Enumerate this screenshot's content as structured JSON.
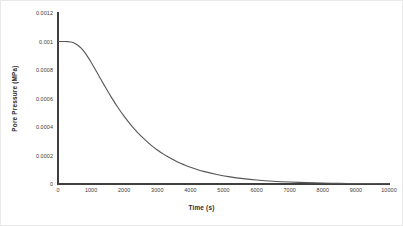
{
  "chart_data": {
    "type": "line",
    "title": "",
    "xlabel": "Time (s)",
    "ylabel": "Pore Pressure (MPa)",
    "xlim": [
      0,
      10000
    ],
    "ylim": [
      0,
      0.0012
    ],
    "grid": false,
    "legend": null,
    "xticks": [
      "0",
      "1000",
      "2000",
      "3000",
      "4000",
      "5000",
      "6000",
      "7000",
      "8000",
      "9000",
      "10000"
    ],
    "xtick_values": [
      0,
      1000,
      2000,
      3000,
      4000,
      5000,
      6000,
      7000,
      8000,
      9000,
      10000
    ],
    "yticks": [
      "0",
      "0.0002",
      "0.0004",
      "0.0006",
      "0.0008",
      "0.001",
      "0.0012"
    ],
    "ytick_values": [
      0,
      0.0002,
      0.0004,
      0.0006,
      0.0008,
      0.001,
      0.0012
    ],
    "series": [
      {
        "name": "Pore Pressure",
        "color": "#555555",
        "x": [
          0,
          100,
          200,
          300,
          400,
          500,
          600,
          700,
          800,
          900,
          1000,
          1200,
          1400,
          1600,
          1800,
          2000,
          2200,
          2400,
          2600,
          2800,
          3000,
          3200,
          3400,
          3600,
          3800,
          4000,
          4400,
          4800,
          5200,
          5600,
          6000,
          6500,
          7000,
          7500,
          8000,
          8500,
          9000,
          9500,
          10000
        ],
        "y": [
          0.001,
          0.001,
          0.001,
          0.000999,
          0.000996,
          0.000988,
          0.000974,
          0.000953,
          0.000925,
          0.000892,
          0.000855,
          0.000774,
          0.000692,
          0.000613,
          0.00054,
          0.000474,
          0.000415,
          0.000362,
          0.000316,
          0.000275,
          0.000239,
          0.000208,
          0.000181,
          0.000157,
          0.000136,
          0.000118,
          8.87e-05,
          6.66e-05,
          5e-05,
          3.75e-05,
          2.82e-05,
          1.97e-05,
          1.38e-05,
          9.63e-06,
          6.73e-06,
          4.7e-06,
          3.29e-06,
          2.3e-06,
          1.6e-06
        ]
      }
    ]
  },
  "axes": {
    "x_title": "Time (s)",
    "y_title": "Pore Pressure  (MPa)"
  },
  "colors": {
    "curve": "#555555",
    "axis": "#3f3f3f",
    "tick_text": "#3a3a3a",
    "title_text": "#2b2b2b",
    "background": "#ffffff",
    "frame": "#e9e9e9"
  }
}
